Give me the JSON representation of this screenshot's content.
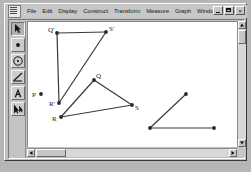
{
  "window": {
    "system_menu_icon": "document-icon",
    "controls": [
      {
        "name": "minimize",
        "glyph": "_"
      },
      {
        "name": "restore",
        "glyph": "□"
      },
      {
        "name": "close",
        "glyph": "×"
      }
    ]
  },
  "menubar": {
    "items": [
      {
        "label": "File"
      },
      {
        "label": "Edit"
      },
      {
        "label": "Display"
      },
      {
        "label": "Construct"
      },
      {
        "label": "Transform"
      },
      {
        "label": "Measure"
      },
      {
        "label": "Graph"
      },
      {
        "label": "Window"
      },
      {
        "label": "Help"
      }
    ]
  },
  "toolbar": {
    "tools": [
      {
        "name": "selection-arrow-tool",
        "icon": "arrow-icon",
        "active": true
      },
      {
        "name": "point-tool",
        "icon": "point-icon",
        "active": false
      },
      {
        "name": "compass-tool",
        "icon": "circle-icon",
        "active": false
      },
      {
        "name": "straightedge-tool",
        "icon": "line-icon",
        "active": false
      },
      {
        "name": "text-tool",
        "icon": "letter-a-icon",
        "active": false
      },
      {
        "name": "custom-tool",
        "icon": "custom-tool-icon",
        "active": false
      }
    ]
  },
  "canvas": {
    "stroke_color": "#3a3a3a",
    "point_color": "#2a2a2a",
    "background": "#ffffff",
    "points": [
      {
        "id": "Qp",
        "label": "Q'",
        "x": 29,
        "y": 11,
        "label_dx": -9,
        "label_dy": -2
      },
      {
        "id": "Sp",
        "label": "S'",
        "x": 78,
        "y": 10,
        "label_dx": 3,
        "label_dy": -2
      },
      {
        "id": "Rp",
        "label": "R'",
        "x": 31,
        "y": 81,
        "label_dx": -10,
        "label_dy": 2
      },
      {
        "id": "P",
        "label": "P",
        "x": 13,
        "y": 72,
        "label_dx": -9,
        "label_dy": 2
      },
      {
        "id": "Q",
        "label": "Q",
        "x": 66,
        "y": 58,
        "label_dx": 2,
        "label_dy": -3
      },
      {
        "id": "S",
        "label": "S",
        "x": 104,
        "y": 83,
        "label_dx": 3,
        "label_dy": 4
      },
      {
        "id": "R",
        "label": "R",
        "x": 33,
        "y": 95,
        "label_dx": -9,
        "label_dy": 3
      },
      {
        "id": "A",
        "label": "",
        "x": 158,
        "y": 72,
        "label_dx": 0,
        "label_dy": 0
      },
      {
        "id": "B",
        "label": "",
        "x": 122,
        "y": 106,
        "label_dx": 0,
        "label_dy": 0
      },
      {
        "id": "C",
        "label": "",
        "x": 186,
        "y": 106,
        "label_dx": 0,
        "label_dy": 0
      }
    ],
    "segments": [
      {
        "name": "segment-Qp-Sp",
        "from": "Qp",
        "to": "Sp"
      },
      {
        "name": "segment-Qp-Rp",
        "from": "Qp",
        "to": "Rp"
      },
      {
        "name": "segment-Sp-Rp",
        "from": "Sp",
        "to": "Rp"
      },
      {
        "name": "segment-Q-S",
        "from": "Q",
        "to": "S"
      },
      {
        "name": "segment-Q-R",
        "from": "Q",
        "to": "R"
      },
      {
        "name": "segment-R-S",
        "from": "R",
        "to": "S"
      },
      {
        "name": "segment-A-B",
        "from": "A",
        "to": "B"
      },
      {
        "name": "segment-B-C",
        "from": "B",
        "to": "C"
      }
    ]
  },
  "scrollbars": {
    "vertical": {
      "up": "scroll-up-arrow",
      "down": "scroll-down-arrow"
    },
    "horizontal": {
      "left": "scroll-left-arrow",
      "right": "scroll-right-arrow"
    }
  }
}
